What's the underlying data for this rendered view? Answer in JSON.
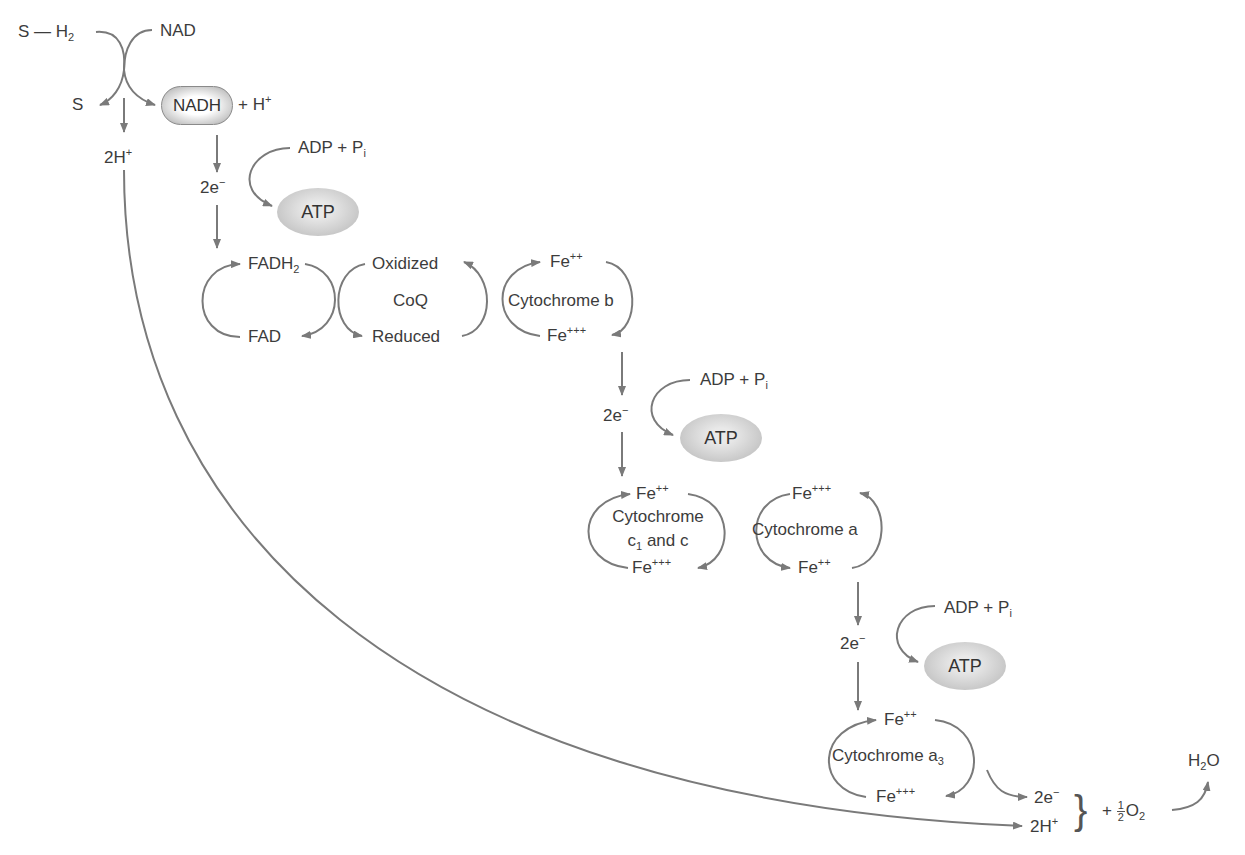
{
  "diagram": {
    "substrate": {
      "reduced": "S — H",
      "reduced_sub": "2",
      "oxidized": "S"
    },
    "nad": {
      "oxidized": "NAD",
      "reduced": "NADH",
      "plus_h": "+ H",
      "plus_h_sup": "+"
    },
    "protons_top": {
      "text": "2H",
      "sup": "+"
    },
    "electrons": {
      "text": "2e",
      "sup": "−"
    },
    "adp": {
      "text": "ADP + P",
      "sub": "i"
    },
    "atp": "ATP",
    "fad": {
      "reduced": "FADH",
      "reduced_sub": "2",
      "oxidized": "FAD"
    },
    "coq": {
      "name": "CoQ",
      "oxidized": "Oxidized",
      "reduced": "Reduced"
    },
    "cyt_b": {
      "name": "Cytochrome b",
      "fe2": "Fe",
      "fe2_sup": "++",
      "fe3": "Fe",
      "fe3_sup": "+++"
    },
    "cyt_c": {
      "name_line1": "Cytochrome",
      "name_line2_pre": "c",
      "name_line2_sub": "1",
      "name_line2_post": " and c",
      "fe2": "Fe",
      "fe2_sup": "++",
      "fe3": "Fe",
      "fe3_sup": "+++"
    },
    "cyt_a": {
      "name": "Cytochrome a",
      "fe3": "Fe",
      "fe3_sup": "+++",
      "fe2": "Fe",
      "fe2_sup": "++"
    },
    "cyt_a3": {
      "name": "Cytochrome a",
      "name_sub": "3",
      "fe2": "Fe",
      "fe2_sup": "++",
      "fe3": "Fe",
      "fe3_sup": "+++"
    },
    "final": {
      "electrons": "2e",
      "electrons_sup": "−",
      "protons": "2H",
      "protons_sup": "+",
      "brace": "}",
      "plus": "+",
      "half_num": "1",
      "half_den": "2",
      "oxygen": "O",
      "oxygen_sub": "2",
      "water": "H",
      "water_sub": "2",
      "water_post": "O"
    },
    "colors": {
      "arrow": "#7a7a7a",
      "text": "#3c3c3c"
    }
  }
}
